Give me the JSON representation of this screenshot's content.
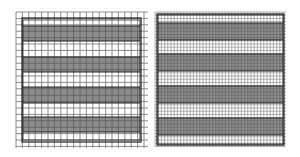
{
  "figure": {
    "panels": [
      {
        "name": "coarse-grid-panel",
        "frame": {
          "x": 22,
          "y": 18,
          "w": 119,
          "h": 124
        },
        "inner": {
          "x": 23,
          "y": 20,
          "w": 117,
          "h": 120
        },
        "grid": {
          "x0": 16,
          "x1": 148,
          "y0": 12,
          "y1": 148,
          "step": 6.4
        },
        "bands": [
          {
            "y": 26,
            "h": 15
          },
          {
            "y": 57,
            "h": 15
          },
          {
            "y": 87,
            "h": 16
          },
          {
            "y": 117,
            "h": 15
          }
        ]
      },
      {
        "name": "fine-grid-panel",
        "frame": {
          "x": 157,
          "y": 14,
          "w": 127,
          "h": 131
        },
        "inner": {
          "x": 158,
          "y": 15,
          "w": 125,
          "h": 129
        },
        "grid": {
          "x0": 155,
          "x1": 286,
          "y0": 12,
          "y1": 147,
          "step": 3.2
        },
        "bands": [
          {
            "y": 23,
            "h": 17
          },
          {
            "y": 54,
            "h": 17
          },
          {
            "y": 86,
            "h": 17
          },
          {
            "y": 118,
            "h": 17
          }
        ]
      }
    ],
    "colors": {
      "band": "#8c8c8c",
      "grid": "#555555",
      "frame": "#222222",
      "background": "#ffffff"
    }
  }
}
